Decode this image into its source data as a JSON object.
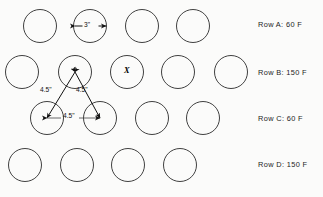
{
  "diagram": {
    "background_color": "#fbfbfa",
    "stroke_color": "#2b2b2b",
    "canvas": {
      "width": 323,
      "height": 197
    }
  },
  "rows": [
    {
      "id": "A",
      "label": "Row A: 60 F",
      "temperature": "60 F",
      "circle_count": 4,
      "staggered": true,
      "label_x": 258,
      "label_y": 20,
      "row_center_y": 26,
      "first_center_x": 40,
      "circles": [
        {
          "cx": 40,
          "cy": 26,
          "r": 16.5
        },
        {
          "cx": 90,
          "cy": 26,
          "r": 16.5
        },
        {
          "cx": 142,
          "cy": 26,
          "r": 16.5
        },
        {
          "cx": 193,
          "cy": 26,
          "r": 16.5
        }
      ]
    },
    {
      "id": "B",
      "label": "Row B: 150 F",
      "temperature": "150 F",
      "circle_count": 5,
      "staggered": false,
      "label_x": 258,
      "label_y": 68,
      "row_center_y": 72,
      "first_center_x": 22,
      "circles": [
        {
          "cx": 22,
          "cy": 72,
          "r": 16.5
        },
        {
          "cx": 75,
          "cy": 72,
          "r": 16.5
        },
        {
          "cx": 127,
          "cy": 72,
          "r": 16.5
        },
        {
          "cx": 178,
          "cy": 72,
          "r": 16.5
        },
        {
          "cx": 231,
          "cy": 72,
          "r": 16.5
        }
      ]
    },
    {
      "id": "C",
      "label": "Row C: 60 F",
      "temperature": "60 F",
      "circle_count": 4,
      "staggered": true,
      "label_x": 258,
      "label_y": 114,
      "row_center_y": 118,
      "first_center_x": 47,
      "circles": [
        {
          "cx": 47,
          "cy": 118,
          "r": 16.5
        },
        {
          "cx": 100,
          "cy": 118,
          "r": 16.5
        },
        {
          "cx": 152,
          "cy": 118,
          "r": 16.5
        },
        {
          "cx": 203,
          "cy": 118,
          "r": 16.5
        }
      ]
    },
    {
      "id": "D",
      "label": "Row D: 150 F",
      "temperature": "150 F",
      "circle_count": 4,
      "staggered": false,
      "label_x": 258,
      "label_y": 160,
      "row_center_y": 165,
      "first_center_x": 25,
      "circles": [
        {
          "cx": 25,
          "cy": 165,
          "r": 16.5
        },
        {
          "cx": 77,
          "cy": 165,
          "r": 16.5
        },
        {
          "cx": 128,
          "cy": 165,
          "r": 16.5
        },
        {
          "cx": 180,
          "cy": 165,
          "r": 16.5
        }
      ]
    }
  ],
  "annotations": {
    "diameter_dimension": {
      "value": "3\"",
      "measure": "circle diameter",
      "on_row": "A",
      "on_circle_index": 1,
      "text_x": 84,
      "text_y": 22,
      "line_y": 26,
      "line_x1": 75,
      "line_x2": 106
    },
    "marker": {
      "value": "X",
      "meaning": "marked nozzle position",
      "on_row": "B",
      "on_circle_index": 2,
      "text_x": 124,
      "text_y": 67
    },
    "triangle_dimensions": {
      "apex": {
        "x": 75,
        "y": 72,
        "on_row": "B",
        "on_circle_index": 1
      },
      "left_vertex": {
        "x": 47,
        "y": 118,
        "on_row": "C",
        "on_circle_index": 0
      },
      "right_vertex": {
        "x": 100,
        "y": 118,
        "on_row": "C",
        "on_circle_index": 1
      },
      "legs": [
        {
          "value": "4.5\"",
          "side": "left",
          "text_x": 43,
          "text_y": 89
        },
        {
          "value": "4.5\"",
          "side": "right",
          "text_x": 78,
          "text_y": 89
        }
      ],
      "base": {
        "value": "4.5\"",
        "text_x": 64,
        "text_y": 113
      }
    }
  }
}
